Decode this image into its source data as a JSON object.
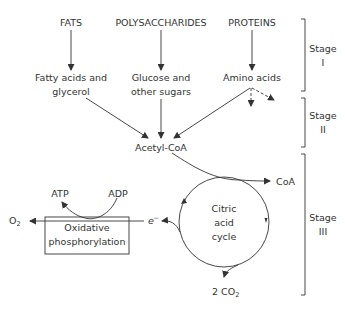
{
  "diagram": {
    "sources": {
      "fats": "FATS",
      "polysaccharides": "POLYSACCHARIDES",
      "proteins": "PROTEINS"
    },
    "products": {
      "fatty_acids_line1": "Fatty acids and",
      "fatty_acids_line2": "glycerol",
      "glucose_line1": "Glucose and",
      "glucose_line2": "other sugars",
      "amino_acids": "Amino acids"
    },
    "acetyl_coa": "Acetyl-CoA",
    "coa": "CoA",
    "cycle": {
      "line1": "Citric",
      "line2": "acid",
      "line3": "cycle"
    },
    "electron": "e",
    "electron_sup": "−",
    "co2_prefix": "2 CO",
    "co2_sub": "2",
    "atp": "ATP",
    "adp": "ADP",
    "o2": "O",
    "o2_sub": "2",
    "oxphos_line1": "Oxidative",
    "oxphos_line2": "phosphorylation",
    "stages": [
      {
        "line1": "Stage",
        "line2": "I"
      },
      {
        "line1": "Stage",
        "line2": "II"
      },
      {
        "line1": "Stage",
        "line2": "III"
      }
    ],
    "colors": {
      "ink": "#333333",
      "background": "#ffffff"
    }
  }
}
